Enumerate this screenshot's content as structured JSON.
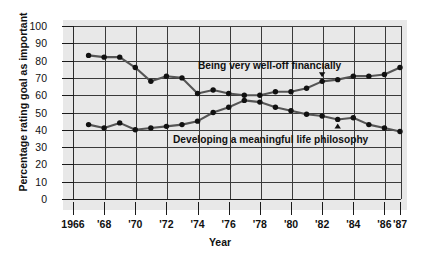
{
  "chart_data": {
    "type": "line",
    "title": "",
    "xlabel": "Year",
    "ylabel": "Percentage rating goal as important",
    "xlim": [
      1966,
      1987
    ],
    "ylim": [
      0,
      100
    ],
    "grid": true,
    "legend_position": "inline-annotations",
    "x": [
      1967,
      1968,
      1969,
      1970,
      1971,
      1972,
      1973,
      1974,
      1975,
      1976,
      1977,
      1978,
      1979,
      1980,
      1981,
      1982,
      1983,
      1984,
      1985,
      1986,
      1987
    ],
    "xtick_labels": [
      "1966",
      "'68",
      "'70",
      "'72",
      "'74",
      "'76",
      "'78",
      "'80",
      "'82",
      "'84",
      "'86",
      "'87"
    ],
    "xtick_values": [
      1966,
      1968,
      1970,
      1972,
      1974,
      1976,
      1978,
      1980,
      1982,
      1984,
      1986,
      1987
    ],
    "ytick_labels": [
      "0",
      "10",
      "20",
      "30",
      "40",
      "50",
      "60",
      "70",
      "80",
      "90",
      "100"
    ],
    "ytick_values": [
      0,
      10,
      20,
      30,
      40,
      50,
      60,
      70,
      80,
      90,
      100
    ],
    "series": [
      {
        "name": "Being very well-off financially",
        "label": "Being very well-off financially",
        "marker": "filled-circle",
        "values": [
          83,
          82,
          82,
          76,
          68,
          71,
          70,
          61,
          63,
          61,
          60,
          60,
          62,
          62,
          64,
          68,
          69,
          71,
          71,
          72,
          76
        ]
      },
      {
        "name": "Developing a meaningful life philosophy",
        "label": "Developing a meaningful life philosophy",
        "marker": "filled-circle",
        "values": [
          43,
          41,
          44,
          40,
          41,
          42,
          43,
          45,
          50,
          53,
          57,
          56,
          53,
          51,
          49,
          48,
          46,
          47,
          43,
          41,
          39
        ]
      }
    ],
    "annotations": [
      {
        "name": "down-triangle-marker",
        "series": "Being very well-off financially",
        "x": 1982
      },
      {
        "name": "up-triangle-marker",
        "series": "Developing a meaningful life philosophy",
        "x": 1983
      }
    ]
  },
  "axes": {
    "x_title": "Year",
    "y_title": "Percentage rating goal as important"
  },
  "colors": {
    "plot_background": "#e8e8e8",
    "grid": "#3a3a3a",
    "line": "#555555",
    "marker": "#111111",
    "text": "#111111",
    "page_background": "#ffffff"
  }
}
